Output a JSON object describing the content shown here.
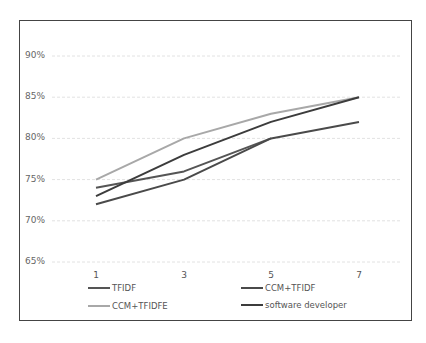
{
  "chart_data": {
    "type": "line",
    "title": "",
    "xlabel": "",
    "ylabel": "",
    "x": [
      "1",
      "3",
      "5",
      "7"
    ],
    "ylim": [
      0.65,
      0.9
    ],
    "yticks": [
      "90%",
      "85%",
      "80%",
      "75%",
      "70%",
      "65%"
    ],
    "grid": true,
    "legend_position": "bottom",
    "series": [
      {
        "name": "TFIDF",
        "values": [
          0.74,
          0.76,
          0.8,
          null
        ],
        "color": "#555555"
      },
      {
        "name": "CCM+TFIDF",
        "values": [
          0.72,
          0.75,
          0.8,
          0.82
        ],
        "color": "#4a4a4a"
      },
      {
        "name": "CCM+TFIDFE",
        "values": [
          0.75,
          0.8,
          0.83,
          0.85
        ],
        "color": "#a8a8a8"
      },
      {
        "name": "software developer",
        "values": [
          0.73,
          0.78,
          0.82,
          0.85
        ],
        "color": "#3c3c3c"
      }
    ]
  },
  "legend": {
    "items": [
      {
        "label": "TFIDF",
        "color": "#555555"
      },
      {
        "label": "CCM+TFIDF",
        "color": "#4a4a4a"
      },
      {
        "label": "CCM+TFIDFE",
        "color": "#a8a8a8"
      },
      {
        "label": "software developer",
        "color": "#3c3c3c"
      }
    ]
  },
  "axis": {
    "yticks": [
      "90%",
      "85%",
      "80%",
      "75%",
      "70%",
      "65%"
    ],
    "xticks": [
      "1",
      "3",
      "5",
      "7"
    ]
  }
}
